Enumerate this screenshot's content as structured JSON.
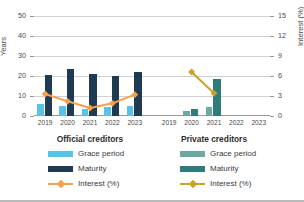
{
  "chart_data": {
    "type": "bar",
    "title": "",
    "ylabel": "Years",
    "y2label": "Interest (%)",
    "xlabel": "",
    "ylim": [
      0,
      55
    ],
    "y2lim": [
      0,
      16.5
    ],
    "yticks": [
      "0",
      "10",
      "20",
      "30",
      "40",
      "50"
    ],
    "ytick_values": [
      0,
      10,
      20,
      30,
      40,
      50
    ],
    "y2ticks": [
      "0",
      "3",
      "6",
      "9",
      "12",
      "15"
    ],
    "y2tick_values": [
      0,
      3,
      6,
      9,
      12,
      15
    ],
    "grid": true,
    "legend_position": "bottom",
    "panels": [
      {
        "name": "Official creditors",
        "categories": [
          "2019",
          "2020",
          "2021",
          "2022",
          "2023"
        ],
        "series": [
          {
            "name": "Grace period",
            "type": "bar",
            "axis": "left",
            "color": "#5BC2E7",
            "values": [
              6.0,
              5.0,
              3.5,
              4.5,
              5.0
            ]
          },
          {
            "name": "Maturity",
            "type": "bar",
            "axis": "left",
            "color": "#1F3A53",
            "values": [
              20.5,
              23.4,
              21.2,
              19.8,
              22.0
            ]
          },
          {
            "name": "Interest (%)",
            "type": "line",
            "axis": "right",
            "color": "#F5A04B",
            "values": [
              3.3,
              2.2,
              1.2,
              1.9,
              3.2
            ]
          }
        ]
      },
      {
        "name": "Private creditors",
        "categories": [
          "2019",
          "2020",
          "2021",
          "2022",
          "2023"
        ],
        "series": [
          {
            "name": "Grace period",
            "type": "bar",
            "axis": "left",
            "color": "#6FA8A0",
            "values": [
              null,
              2.4,
              4.5,
              null,
              null
            ]
          },
          {
            "name": "Maturity",
            "type": "bar",
            "axis": "left",
            "color": "#2E7D7B",
            "values": [
              null,
              3.4,
              18.3,
              null,
              null
            ]
          },
          {
            "name": "Interest (%)",
            "type": "line",
            "axis": "right",
            "color": "#C9A227",
            "values": [
              null,
              6.6,
              3.4,
              null,
              null
            ]
          }
        ]
      }
    ]
  },
  "axes": {
    "left_title": "Years",
    "right_title": "Interest (%)"
  },
  "panel_titles": {
    "official": "Official creditors",
    "private": "Private creditors"
  },
  "legend_official": {
    "grace": "Grace period",
    "maturity": "Maturity",
    "interest": "Interest (%)"
  },
  "legend_private": {
    "grace": "Grace period",
    "maturity": "Maturity",
    "interest": "Interest (%)"
  },
  "colors": {
    "official_grace": "#5BC2E7",
    "official_maturity": "#1F3A53",
    "official_interest": "#F5A04B",
    "private_grace": "#6FA8A0",
    "private_maturity": "#2E7D7B",
    "private_interest": "#C9A227",
    "grid": "#d0d0d0",
    "axis": "#9a9a9a"
  }
}
